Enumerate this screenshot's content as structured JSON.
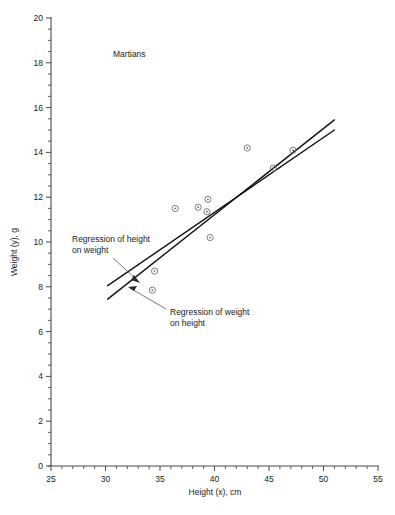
{
  "chart_data": {
    "type": "scatter",
    "title": "Martians",
    "xlabel": "Height (x), cm",
    "ylabel": "Weight (y), g",
    "xlim": [
      25,
      55
    ],
    "ylim": [
      0,
      20
    ],
    "x_major_step": 5,
    "x_minor_step": 1,
    "y_major_step": 2,
    "y_minor_step": 0.5,
    "grid": false,
    "legend": "none",
    "x_ticks": [
      25,
      30,
      35,
      40,
      45,
      50,
      55
    ],
    "y_ticks": [
      0,
      2,
      4,
      6,
      8,
      10,
      12,
      14,
      16,
      18,
      20
    ],
    "x": [
      34.3,
      34.5,
      36.4,
      38.5,
      39.3,
      39.4,
      39.6,
      43.0,
      45.4,
      47.2
    ],
    "y": [
      7.85,
      8.7,
      11.5,
      11.55,
      11.35,
      11.9,
      10.2,
      14.2,
      13.3,
      14.1
    ],
    "points": [
      {
        "x": 34.3,
        "y": 7.85
      },
      {
        "x": 34.5,
        "y": 8.7
      },
      {
        "x": 36.4,
        "y": 11.5
      },
      {
        "x": 38.5,
        "y": 11.55
      },
      {
        "x": 39.3,
        "y": 11.35
      },
      {
        "x": 39.4,
        "y": 11.9
      },
      {
        "x": 39.6,
        "y": 10.2
      },
      {
        "x": 43.0,
        "y": 14.2
      },
      {
        "x": 45.4,
        "y": 13.3
      },
      {
        "x": 47.2,
        "y": 14.1
      }
    ],
    "series": [
      {
        "name": "Regression of weight on height",
        "type": "line",
        "x": [
          30.2,
          51.0
        ],
        "y": [
          7.45,
          15.45
        ]
      },
      {
        "name": "Regression of height on weight",
        "type": "line",
        "x": [
          30.2,
          51.0
        ],
        "y": [
          8.05,
          15.0
        ]
      }
    ],
    "annotations": [
      {
        "text": "Regression of height on weight",
        "target_x": 32.1,
        "target_y": 8.55
      },
      {
        "text": "Regression of weight on height",
        "target_x": 33.0,
        "target_y": 8.25
      }
    ]
  },
  "annotation_height_on_weight": {
    "line1": "Regression of height",
    "line2": "on weight"
  },
  "annotation_weight_on_height": {
    "line1": "Regression of weight",
    "line2": "on height"
  },
  "axis": {
    "x_title": "Height (x), cm",
    "y_title": "Weight (y), g",
    "x_labels": [
      "25",
      "30",
      "35",
      "40",
      "45",
      "50",
      "55"
    ],
    "y_labels": [
      "0",
      "2",
      "4",
      "6",
      "8",
      "10",
      "12",
      "14",
      "16",
      "18",
      "20"
    ]
  },
  "title": "Martians"
}
